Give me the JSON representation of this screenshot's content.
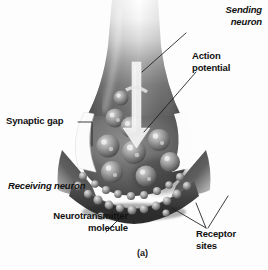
{
  "figure": {
    "caption": "(a)",
    "background_color": "#fdfdfd",
    "style": "grayscale airbrushed biological illustration"
  },
  "labels": {
    "sending_neuron": "Sending\nneuron",
    "action_potential": "Action\npotential",
    "synaptic_gap": "Synaptic gap",
    "receiving_neuron": "Receiving neuron",
    "neurotransmitter_molecule": "Neurotransmitter\nmolecule",
    "receptor_sites": "Receptor\nsites"
  },
  "colors": {
    "label_text": "#111111",
    "leader_line": "#1a1a1a",
    "terminal_dark": "#4a4a4a",
    "terminal_mid": "#787878",
    "terminal_light": "#d8d8d8",
    "membrane_dark": "#3c3c3c",
    "gap_white": "#fbfbfb",
    "arrow_white": "#f2f2f2",
    "vesicle_light": "#b9b9b9"
  },
  "structures": {
    "axon_terminal": "funnel-shaped presynaptic terminal fading to white at top",
    "action_potential_arrow": "white downward arrow through terminal",
    "synaptic_vesicles": 9,
    "receptor_bumps": 22,
    "synaptic_cleft": "white wedge between sending and receiving neuron"
  }
}
